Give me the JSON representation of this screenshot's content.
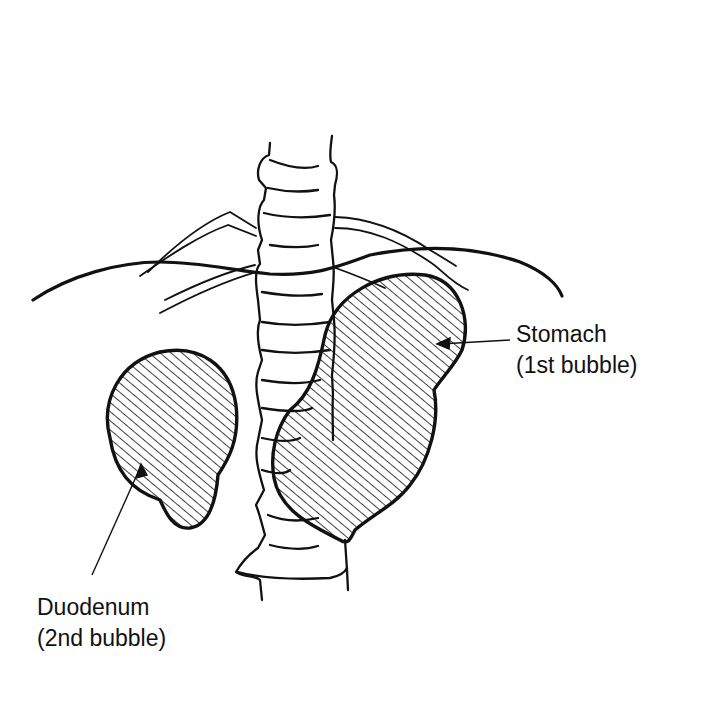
{
  "figure": {
    "type": "anatomical line drawing",
    "colors": {
      "ink": "#111111",
      "background": "#ffffff"
    }
  },
  "labels": {
    "stomach": {
      "line1": "Stomach",
      "line2": "(1st bubble)"
    },
    "duodenum": {
      "line1": "Duodenum",
      "line2": "(2nd bubble)"
    }
  }
}
